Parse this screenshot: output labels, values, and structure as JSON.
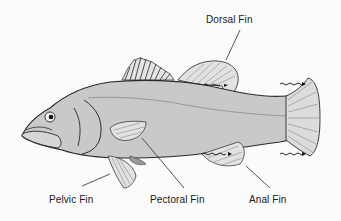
{
  "diagram": {
    "labels": {
      "dorsal_fin": "Dorsal Fin",
      "pelvic_fin": "Pelvic Fin",
      "pectoral_fin": "Pectoral Fin",
      "anal_fin": "Anal Fin"
    },
    "colors": {
      "body": "#c9c9c9",
      "outline": "#2a2a2a",
      "fin": "#e2e2e2",
      "label_text": "#1a1a1a",
      "background": "#fbfbfb"
    }
  }
}
